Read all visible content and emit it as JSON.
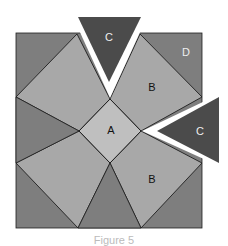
{
  "figure": {
    "colors": {
      "background": "#ffffff",
      "outer_region": "#7e7e7e",
      "kite_B": "#a8a8a8",
      "square_A": "#bfbfbf",
      "triangle_C": "#4b4b4b",
      "outline": "#1e1e1e",
      "label_dark": "#111111",
      "label_light": "#eeeeee"
    },
    "labels": {
      "A": "A",
      "B_top": "B",
      "B_bottom": "B",
      "C_top": "C",
      "C_right": "C",
      "D": "D"
    },
    "caption": "Figure 5"
  }
}
